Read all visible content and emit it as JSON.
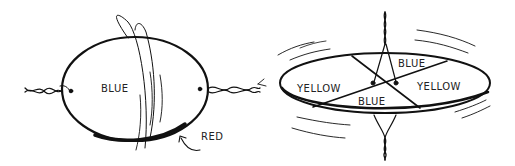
{
  "figures": [
    {
      "id": "left-disk",
      "labels": {
        "face": "BLUE",
        "edge": "RED"
      }
    },
    {
      "id": "right-disk",
      "labels": {
        "top_sector": "BLUE",
        "bottom_sector": "BLUE",
        "left_sector": "YELLOW",
        "right_sector": "YELLOW"
      }
    }
  ],
  "colors": {
    "ink": "#111111",
    "background": "#ffffff"
  }
}
